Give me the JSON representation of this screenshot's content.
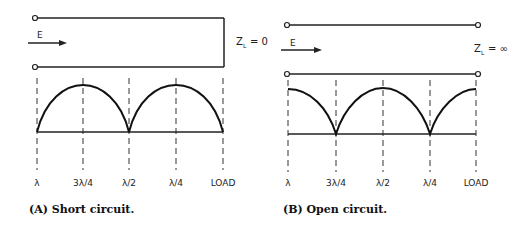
{
  "panels": [
    {
      "id": "A",
      "caption": "(A)  Short circuit.",
      "wave_label": "E",
      "load_label": "Z",
      "load_sub": "L",
      "load_value": "= 0",
      "ticks": [
        "λ",
        "3λ/4",
        "λ/2",
        "λ/4",
        "LOAD"
      ]
    },
    {
      "id": "B",
      "caption": "(B)  Open circuit.",
      "wave_label": "E",
      "load_label": "Z",
      "load_sub": "L",
      "load_value": "= ∞",
      "ticks": [
        "λ",
        "3λ/4",
        "λ/2",
        "λ/4",
        "LOAD"
      ]
    }
  ]
}
